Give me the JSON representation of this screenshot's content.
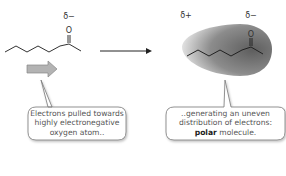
{
  "left_molecule": {
    "delta_label": "δ−",
    "atom_label": "O"
  },
  "right_molecule": {
    "delta_plus_label": "δ+",
    "delta_minus_label": "δ−",
    "atom_label": "O"
  },
  "left_callout": {
    "lines": [
      "Electrons pulled towards",
      "highly electronegative",
      "oxygen atom.."
    ]
  },
  "right_callout": {
    "line1": "..generating an uneven",
    "line2": "distribution of electrons:",
    "bold_word": "polar",
    "line3_rest": " molecule."
  },
  "colors": {
    "cloud_dark": "#6e6e6e",
    "cloud_light": "#f2f2f2",
    "arrow_fill": "#b3b3b3",
    "bubble_border": "#777777"
  }
}
